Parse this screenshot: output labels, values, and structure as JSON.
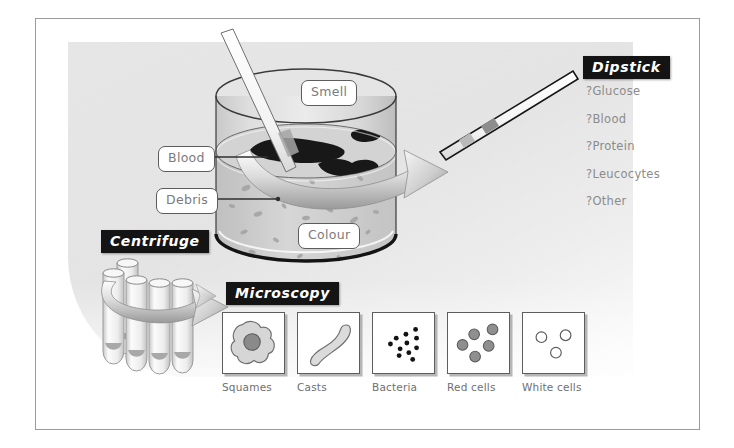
{
  "figure": {
    "colors": {
      "tag_bg": "#141414",
      "tag_text": "#ffffff",
      "callout_text": "#7b7b7b",
      "list_text": "#8b8b8b",
      "panel_bg": "#e6e6e6",
      "ink": "#3a3a3a",
      "blood": "#1c1c1c",
      "cell_fill": "#8f8f8f"
    }
  },
  "specimen": {
    "callouts": [
      {
        "id": "smell",
        "label": "Smell"
      },
      {
        "id": "blood",
        "label": "Blood"
      },
      {
        "id": "debris",
        "label": "Debris"
      },
      {
        "id": "colour",
        "label": "Colour"
      }
    ]
  },
  "dipstick": {
    "tag": "Dipstick",
    "items": [
      "?Glucose",
      "?Blood",
      "?Protein",
      "?Leucocytes",
      "?Other"
    ]
  },
  "centrifuge": {
    "tag": "Centrifuge",
    "tube_count": 5
  },
  "microscopy": {
    "tag": "Microscopy",
    "panels": [
      {
        "id": "squames",
        "label": "Squames"
      },
      {
        "id": "casts",
        "label": "Casts"
      },
      {
        "id": "bacteria",
        "label": "Bacteria"
      },
      {
        "id": "red-cells",
        "label": "Red cells"
      },
      {
        "id": "white-cells",
        "label": "White cells"
      }
    ]
  }
}
